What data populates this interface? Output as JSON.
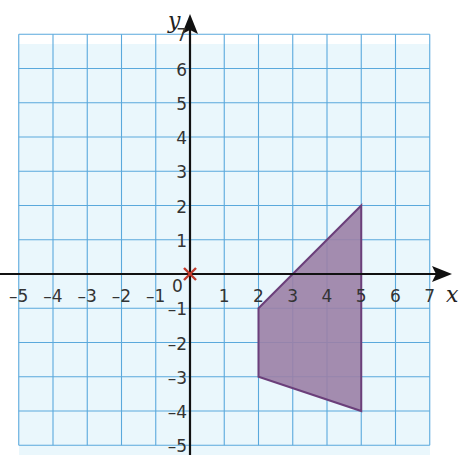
{
  "chart_data": {
    "type": "polygon-on-grid",
    "title": "",
    "xlabel": "x",
    "ylabel": "y",
    "xlim": [
      -5,
      7
    ],
    "ylim": [
      -5,
      7
    ],
    "grid": true,
    "x_ticks": [
      "-5",
      "-4",
      "-3",
      "-2",
      "-1",
      "1",
      "2",
      "3",
      "4",
      "5",
      "6",
      "7"
    ],
    "y_ticks": [
      "7",
      "6",
      "5",
      "4",
      "3",
      "2",
      "1",
      "-1",
      "-2",
      "-3",
      "-4",
      "-5"
    ],
    "origin_label": "0",
    "polygon": {
      "vertices": [
        [
          2,
          -1
        ],
        [
          5,
          2
        ],
        [
          5,
          -4
        ],
        [
          2,
          -3
        ]
      ],
      "fill": "#9b7fa6",
      "stroke": "#6b3f7a"
    },
    "marked_point": {
      "x": 0,
      "y": 0,
      "marker": "cross",
      "color": "#c0392b"
    },
    "colors": {
      "grid": "#5aa9dc",
      "background": "#eaf7fc",
      "axis": "#111111"
    }
  }
}
